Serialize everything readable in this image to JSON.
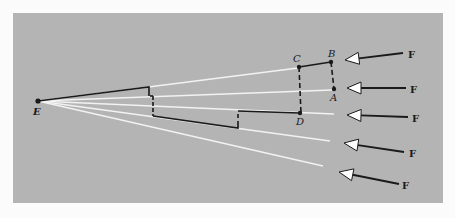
{
  "figure": {
    "colors": {
      "background": "#b4b4b4",
      "ray": "#f2f2f2",
      "path": "#1a1a1a",
      "arrow_head_fill": "#ffffff"
    },
    "points": {
      "E": "E",
      "A": "A",
      "B": "B",
      "C": "C",
      "D": "D"
    },
    "arrow_label": "F",
    "arrows": [
      {
        "label": "F"
      },
      {
        "label": "F"
      },
      {
        "label": "F"
      },
      {
        "label": "F"
      },
      {
        "label": "F"
      }
    ],
    "ray_count": 5
  }
}
